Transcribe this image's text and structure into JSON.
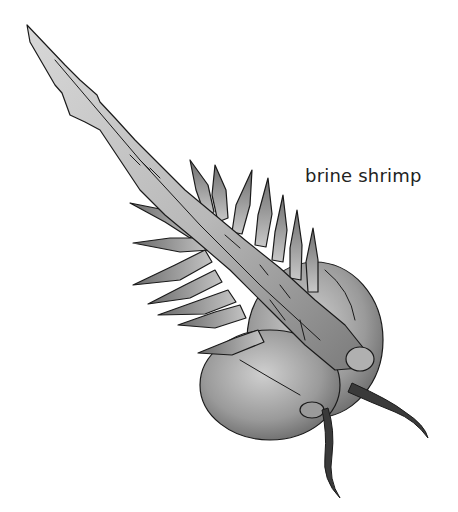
{
  "figure": {
    "label": "brine shrimp",
    "colors": {
      "background": "#ffffff",
      "outline": "#1a1a1a",
      "body_light": "#d4d4d4",
      "body_dark": "#6e6e6e",
      "label": "#222222"
    }
  }
}
